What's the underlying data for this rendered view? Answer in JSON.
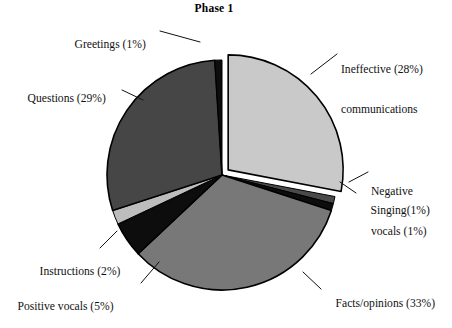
{
  "chart_data": {
    "type": "pie",
    "title": "Phase 1",
    "xlabel": "",
    "ylabel": "",
    "legend": "none (direct labels with leader lines)",
    "start_angle_deg": 90,
    "direction": "clockwise",
    "categories": [
      "Ineffective communications",
      "Negative vocals",
      "Singing",
      "Facts/opinions",
      "Positive vocals",
      "Instructions",
      "Questions",
      "Greetings"
    ],
    "values": [
      28,
      1,
      1,
      33,
      5,
      2,
      29,
      1
    ],
    "units": "percent",
    "total": 100,
    "slices": [
      {
        "name": "Ineffective communications",
        "label_line1": "Ineffective (28%)",
        "label_line2": "communications",
        "value": 28,
        "color": "#c9c9c9",
        "exploded": true
      },
      {
        "name": "Negative vocals",
        "label_line1": "Negative",
        "label_line2": "vocals (1%)",
        "value": 1,
        "color": "#4a4a4a",
        "exploded": false
      },
      {
        "name": "Singing",
        "label_line1": "Singing(1%)",
        "label_line2": "",
        "value": 1,
        "color": "#0d0d0d",
        "exploded": false
      },
      {
        "name": "Facts/opinions",
        "label_line1": "Facts/opinions (33%)",
        "label_line2": "",
        "value": 33,
        "color": "#787878",
        "exploded": false
      },
      {
        "name": "Positive vocals",
        "label_line1": "Positive vocals (5%)",
        "label_line2": "",
        "value": 5,
        "color": "#0d0d0d",
        "exploded": false
      },
      {
        "name": "Instructions",
        "label_line1": "Instructions (2%)",
        "label_line2": "",
        "value": 2,
        "color": "#bdbdbd",
        "exploded": false
      },
      {
        "name": "Questions",
        "label_line1": "Questions (29%)",
        "label_line2": "",
        "value": 29,
        "color": "#464646",
        "exploded": false
      },
      {
        "name": "Greetings",
        "label_line1": "Greetings (1%)",
        "label_line2": "",
        "value": 1,
        "color": "#0d0d0d",
        "exploded": false
      }
    ]
  },
  "labels": {
    "greetings": "Greetings (1%)",
    "ineffective_line1": "Ineffective (28%)",
    "ineffective_line2": "communications",
    "questions": "Questions (29%)",
    "negative_line1": "Negative",
    "negative_line2": "vocals (1%)",
    "singing": "Singing(1%)",
    "instructions": "Instructions (2%)",
    "positive_vocals": "Positive vocals (5%)",
    "facts_opinions": "Facts/opinions (33%)"
  },
  "colors": {
    "ineffective": "#c9c9c9",
    "negative_vocals": "#4a4a4a",
    "singing": "#0d0d0d",
    "facts_opinions": "#787878",
    "positive_vocals": "#0d0d0d",
    "instructions": "#bdbdbd",
    "questions": "#464646",
    "greetings": "#0d0d0d",
    "outline": "#000000",
    "background": "#ffffff",
    "text": "#111111"
  }
}
